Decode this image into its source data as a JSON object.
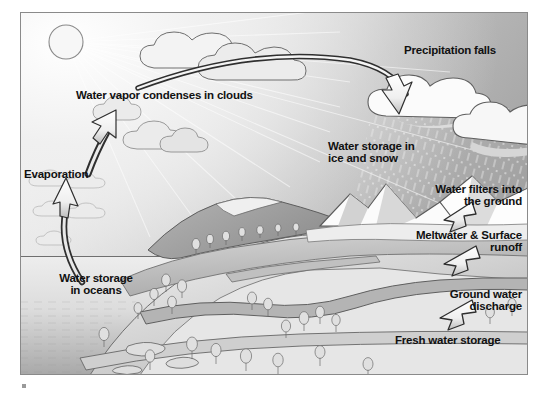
{
  "diagram": {
    "frame": {
      "x": 20,
      "y": 12,
      "width": 508,
      "height": 363
    },
    "palette": {
      "sky": "#b9b9b9",
      "sky_light": "#e9e9e9",
      "ocean": "#d8d8d8",
      "ocean_deep": "#9d9d9d",
      "land_light": "#e2e2e2",
      "land_mid": "#c6c6c6",
      "land_dark": "#a5a5a5",
      "snow": "#fafafa",
      "cloud": "#f2f2f2",
      "outline": "#4a4a4a",
      "text": "#111111",
      "arrow_fill": "#ffffff",
      "arrow_stroke": "#2f2f2f"
    },
    "labels": [
      {
        "name": "evaporation",
        "text": "Evaporation",
        "x": 24,
        "y": 168,
        "size": 11.5,
        "align": "left"
      },
      {
        "name": "water-vapor-condenses",
        "text": "Water vapor condenses in clouds",
        "x": 76,
        "y": 89,
        "size": 11.5,
        "align": "left"
      },
      {
        "name": "water-storage-oceans",
        "text": "Water storage\nin oceans",
        "x": 46,
        "y": 272,
        "size": 11.5,
        "align": "left"
      },
      {
        "name": "precipitation-falls",
        "text": "Precipitation falls",
        "x": 404,
        "y": 44,
        "size": 11.5,
        "align": "left"
      },
      {
        "name": "water-storage-ice-snow",
        "text": "Water storage in\nice and snow",
        "x": 328,
        "y": 140,
        "size": 11.5,
        "align": "left"
      },
      {
        "name": "water-filters-ground",
        "text": "Water filters into\nthe ground",
        "x": 528,
        "y": 183,
        "size": 11.5,
        "align": "right"
      },
      {
        "name": "meltwater-surface-runoff",
        "text": "Meltwater & Surface\nrunoff",
        "x": 528,
        "y": 229,
        "size": 11.5,
        "align": "right"
      },
      {
        "name": "ground-water-discharge",
        "text": "Ground water\ndischarge",
        "x": 528,
        "y": 288,
        "size": 11.5,
        "align": "right"
      },
      {
        "name": "fresh-water-storage",
        "text": "Fresh water storage",
        "x": 395,
        "y": 334,
        "size": 11.5,
        "align": "left"
      }
    ],
    "sun": {
      "cx": 66,
      "cy": 42,
      "r": 17
    },
    "processes": [
      {
        "name": "evaporation",
        "from": "ocean surface",
        "to": "clouds",
        "arrow": "curved-up"
      },
      {
        "name": "condensation",
        "from": "clouds",
        "to": "precipitation cloud",
        "arrow": "long-curve-right"
      },
      {
        "name": "precipitation",
        "from": "cloud",
        "to": "mountains",
        "arrow": "curve-down"
      },
      {
        "name": "infiltration",
        "from": "surface",
        "to": "ground",
        "arrow": "short-left"
      },
      {
        "name": "runoff",
        "from": "meltwater",
        "to": "river",
        "arrow": "short-left"
      },
      {
        "name": "discharge",
        "from": "ground water",
        "to": "river",
        "arrow": "short-left"
      }
    ]
  }
}
